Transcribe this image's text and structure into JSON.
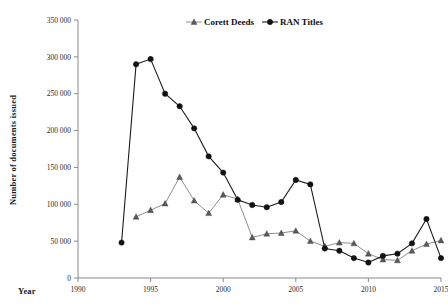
{
  "chart_data": {
    "type": "line",
    "title": "",
    "xlabel": "Year",
    "ylabel": "Number of documents issued",
    "xlim": [
      1990,
      2015
    ],
    "ylim": [
      0,
      350000
    ],
    "xticks": [
      1990,
      1995,
      2000,
      2005,
      2010,
      2015
    ],
    "xticklabels": [
      "1990",
      "1995",
      "2000",
      "2005",
      "2010",
      "2015"
    ],
    "yticks": [
      0,
      50000,
      100000,
      150000,
      200000,
      250000,
      300000,
      350000
    ],
    "yticklabels": [
      "0",
      "50 000",
      "100 000",
      "150 000",
      "200 000",
      "250 000",
      "300 000",
      "350 000"
    ],
    "grid": false,
    "legend_position": "top-center",
    "series": [
      {
        "name": "Corett Deeds",
        "marker": "triangle",
        "color": "#5a5a5a",
        "x": [
          1994,
          1995,
          1996,
          1997,
          1998,
          1999,
          2000,
          2001,
          2002,
          2003,
          2004,
          2005,
          2006,
          2007,
          2008,
          2009,
          2010,
          2011,
          2012,
          2013,
          2014,
          2015
        ],
        "values": [
          83000,
          92000,
          101000,
          137000,
          105000,
          88000,
          113000,
          107000,
          55000,
          60000,
          61000,
          64000,
          50000,
          43000,
          48000,
          47000,
          33000,
          25000,
          24000,
          37000,
          46000,
          51000
        ]
      },
      {
        "name": "RAN Titles",
        "marker": "circle",
        "color": "#121212",
        "x": [
          1993,
          1994,
          1995,
          1996,
          1997,
          1998,
          1999,
          2000,
          2001,
          2002,
          2003,
          2004,
          2005,
          2006,
          2007,
          2008,
          2009,
          2010,
          2011,
          2012,
          2013,
          2014,
          2015
        ],
        "values": [
          48000,
          290000,
          297000,
          250000,
          233000,
          203000,
          165000,
          143000,
          106000,
          99000,
          96000,
          103000,
          133000,
          127000,
          40000,
          37000,
          27000,
          21000,
          30000,
          33000,
          47000,
          80000,
          27000
        ]
      }
    ]
  },
  "legend": {
    "items": [
      {
        "label": "Corett Deeds",
        "marker": "triangle",
        "color": "#5a5a5a"
      },
      {
        "label": "RAN Titles",
        "marker": "circle",
        "color": "#121212"
      }
    ]
  },
  "axes": {
    "x_axis_title": "Year",
    "y_axis_title": "Number of documents issued"
  }
}
